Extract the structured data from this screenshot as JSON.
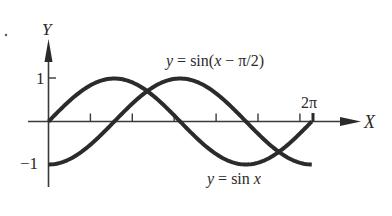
{
  "chart_data": {
    "type": "line",
    "title": "",
    "xlabel": "X",
    "ylabel": "Y",
    "xlim": [
      0,
      7.3
    ],
    "ylim": [
      -1,
      1
    ],
    "grid": false,
    "legend": "inline annotations",
    "x_ticks": [
      1,
      2,
      3,
      4,
      5,
      6
    ],
    "x_tick_labels": [
      {
        "x": 6.2832,
        "label": "2π"
      }
    ],
    "y_ticks": [
      {
        "y": 1,
        "label": "1"
      },
      {
        "y": -1,
        "label": "−1"
      }
    ],
    "series": [
      {
        "name": "y = sin x",
        "function": "sin(x)",
        "x_range": [
          0,
          6.2832
        ],
        "x": [
          0,
          0.7854,
          1.5708,
          2.3562,
          3.1416,
          3.927,
          4.7124,
          5.4978,
          6.2832
        ],
        "values": [
          0,
          0.707,
          1,
          0.707,
          0,
          -0.707,
          -1,
          -0.707,
          0
        ]
      },
      {
        "name": "y = sin(x − π/2)",
        "function": "sin(x - pi/2)",
        "x_range": [
          0,
          6.2832
        ],
        "x": [
          0,
          0.7854,
          1.5708,
          2.3562,
          3.1416,
          3.927,
          4.7124,
          5.4978,
          6.2832
        ],
        "values": [
          -1,
          -0.707,
          0,
          0.707,
          1,
          0.707,
          0,
          -0.707,
          -1
        ]
      }
    ],
    "annotations": [
      {
        "text": "y = sin(x − π/2)",
        "position": "top-right"
      },
      {
        "text": "y = sin x",
        "position": "bottom-right"
      },
      {
        "text": "2π",
        "position": "above x-axis at x=2π"
      }
    ]
  },
  "labels": {
    "y_axis": "Y",
    "x_axis": "X",
    "tick_one": "1",
    "tick_minus_one": "−1",
    "two_pi": "2π",
    "curve_shifted_prefix": "y",
    "curve_shifted_eq": " = sin(",
    "curve_shifted_x": "x",
    "curve_shifted_rest": " − π/2)",
    "curve_sin_prefix": "y",
    "curve_sin_eq": " = sin ",
    "curve_sin_x": "x"
  }
}
